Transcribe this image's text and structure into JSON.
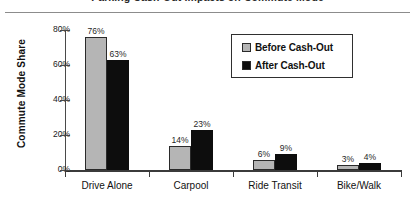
{
  "caption": {
    "text": "Parking Cash-Out Impacts on Commute Mode"
  },
  "axis": {
    "ylabel": "Commute Mode Share",
    "yticks": [
      "0%",
      "20%",
      "40%",
      "60%",
      "80%"
    ]
  },
  "legend": {
    "entries": [
      {
        "label": "Before Cash-Out",
        "color": "#b5b5b5",
        "icon": "legend-swatch-gray"
      },
      {
        "label": "After Cash-Out",
        "color": "#0d0d0d",
        "icon": "legend-swatch-black"
      }
    ]
  },
  "chart_data": {
    "type": "bar",
    "title": "Parking Cash-Out Impacts on Commute Mode",
    "xlabel": "",
    "ylabel": "Commute Mode Share",
    "ylim": [
      0,
      80
    ],
    "ytick_values": [
      0,
      20,
      40,
      60,
      80
    ],
    "ytick_labels": [
      "0%",
      "20%",
      "40%",
      "60%",
      "80%"
    ],
    "grid": false,
    "legend_position": "upper right inside plot",
    "categories": [
      "Drive Alone",
      "Carpool",
      "Ride Transit",
      "Bike/Walk"
    ],
    "series": [
      {
        "name": "Before Cash-Out",
        "color": "#b5b5b5",
        "values": [
          76,
          14,
          6,
          3
        ],
        "data_labels": [
          "76%",
          "14%",
          "6%",
          "3%"
        ]
      },
      {
        "name": "After Cash-Out",
        "color": "#0d0d0d",
        "values": [
          63,
          23,
          9,
          4
        ],
        "data_labels": [
          "63%",
          "23%",
          "9%",
          "4%"
        ]
      }
    ]
  }
}
